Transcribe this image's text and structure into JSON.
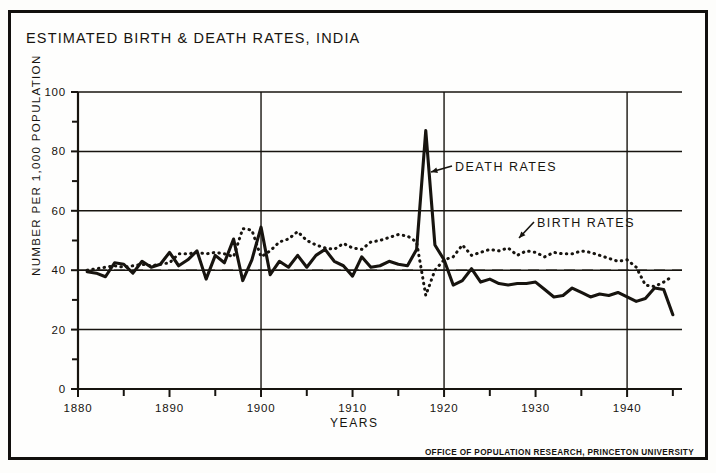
{
  "figure": {
    "title": "ESTIMATED BIRTH & DEATH RATES, INDIA",
    "credit": "OFFICE OF POPULATION RESEARCH, PRINCETON UNIVERSITY"
  },
  "annotations": {
    "death": "DEATH RATES",
    "birth": "BIRTH RATES"
  },
  "chart_data": {
    "type": "line",
    "title": "ESTIMATED BIRTH & DEATH RATES, INDIA",
    "subtitle": "",
    "xlabel": "YEARS",
    "ylabel": "NUMBER PER 1,000 POPULATION",
    "xlim": [
      1880,
      1946
    ],
    "ylim": [
      0,
      100
    ],
    "xticks": [
      1880,
      1890,
      1900,
      1910,
      1920,
      1930,
      1940
    ],
    "xtick_labels": [
      "1880",
      "1890",
      "1900",
      "1910",
      "1920",
      "1930",
      "1940"
    ],
    "xminor_ticks": [
      1885,
      1895,
      1905,
      1915,
      1925,
      1935,
      1945
    ],
    "yticks": [
      0,
      20,
      40,
      60,
      80,
      100
    ],
    "ytick_labels": [
      "0",
      "20",
      "40",
      "60",
      "80",
      "100"
    ],
    "yminor_ticks": [
      10,
      30,
      50,
      70,
      90
    ],
    "grid": "both",
    "gridlines_y": [
      20,
      40,
      60,
      80,
      100
    ],
    "gridlines_x": [
      1900,
      1920,
      1940
    ],
    "reference_line": {
      "value": 40,
      "style": "dashed",
      "label": ""
    },
    "legend_position": "inline-annotations",
    "x": [
      1881,
      1882,
      1883,
      1884,
      1885,
      1886,
      1887,
      1888,
      1889,
      1890,
      1891,
      1892,
      1893,
      1894,
      1895,
      1896,
      1897,
      1898,
      1899,
      1900,
      1901,
      1902,
      1903,
      1904,
      1905,
      1906,
      1907,
      1908,
      1909,
      1910,
      1911,
      1912,
      1913,
      1914,
      1915,
      1916,
      1917,
      1918,
      1919,
      1920,
      1921,
      1922,
      1923,
      1924,
      1925,
      1926,
      1927,
      1928,
      1929,
      1930,
      1931,
      1932,
      1933,
      1934,
      1935,
      1936,
      1937,
      1938,
      1939,
      1940,
      1941,
      1942,
      1943,
      1944,
      1945
    ],
    "series": [
      {
        "name": "DEATH RATES",
        "style": "solid",
        "color": "#17140f",
        "values": [
          39.5,
          39.0,
          37.8,
          42.5,
          42.0,
          39.0,
          43.0,
          41.0,
          42.0,
          46.0,
          41.5,
          43.5,
          46.5,
          37.0,
          45.0,
          42.5,
          50.5,
          36.5,
          43.5,
          54.5,
          38.5,
          43.0,
          41.0,
          45.0,
          41.0,
          45.0,
          47.0,
          43.0,
          41.5,
          38.0,
          44.5,
          41.0,
          41.5,
          43.0,
          42.0,
          41.5,
          47.0,
          87.0,
          48.5,
          43.5,
          35.0,
          36.5,
          40.5,
          36.0,
          37.0,
          35.5,
          35.0,
          35.5,
          35.5,
          36.0,
          33.5,
          31.0,
          31.5,
          34.0,
          32.5,
          31.0,
          32.0,
          31.5,
          32.5,
          31.0,
          29.5,
          30.5,
          34.0,
          33.5,
          25.0
        ]
      },
      {
        "name": "BIRTH RATES",
        "style": "dotted",
        "color": "#17140f",
        "values": [
          40.0,
          40.5,
          41.0,
          41.5,
          41.0,
          41.5,
          42.0,
          41.5,
          42.0,
          42.5,
          45.5,
          45.5,
          46.0,
          45.5,
          46.0,
          45.5,
          44.5,
          54.0,
          53.5,
          44.5,
          46.5,
          49.5,
          50.5,
          53.0,
          50.0,
          48.5,
          47.5,
          47.0,
          49.0,
          47.5,
          47.0,
          49.5,
          50.0,
          51.0,
          52.0,
          51.5,
          49.5,
          31.5,
          40.0,
          43.5,
          44.5,
          48.5,
          45.0,
          46.0,
          47.0,
          46.5,
          47.5,
          45.0,
          46.5,
          46.0,
          44.5,
          46.0,
          45.5,
          45.5,
          46.5,
          46.0,
          45.0,
          44.0,
          43.0,
          43.5,
          41.0,
          35.0,
          34.5,
          36.0,
          38.0
        ]
      }
    ]
  }
}
